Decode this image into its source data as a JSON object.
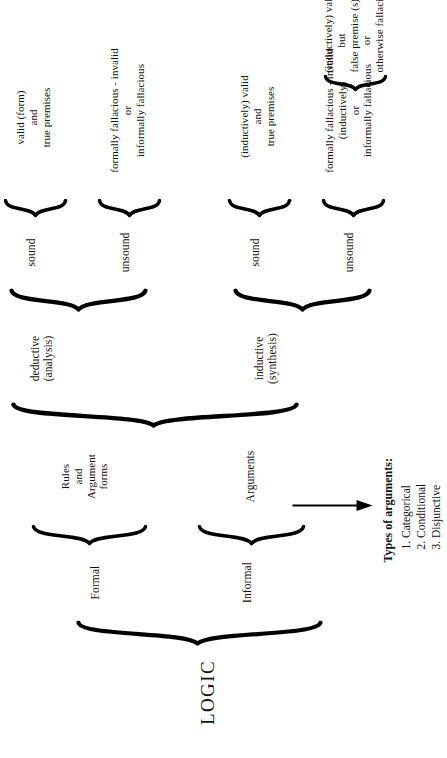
{
  "diagram": {
    "title": "LOGIC",
    "root": {
      "label": "LOGIC"
    },
    "level1": [
      {
        "label": "Formal"
      },
      {
        "label": "Informal"
      }
    ],
    "formal_detail": "Rules\nand\nArgument\nforms",
    "informal_detail": "Arguments",
    "level2": [
      {
        "label": "deductive\n(analysis)"
      },
      {
        "label": "inductive\n(synthesis)"
      }
    ],
    "level3": [
      {
        "label": "sound"
      },
      {
        "label": "unsound"
      },
      {
        "label": "sound"
      },
      {
        "label": "unsound"
      }
    ],
    "leaves": [
      {
        "text": "valid (form)\nand\ntrue premises"
      },
      {
        "text": "formally fallacious - invalid\nor\ninformally fallacious"
      },
      {
        "text": "(inductively) valid\nand\ntrue premises"
      },
      {
        "text": "formally fallacious - invalid\n(inductively)\nor\ninformally fallacious"
      }
    ],
    "leaf_extra": {
      "text": "(inductively) valid\nbut\nfalse premise (s)\nor\notherwise fallacious"
    },
    "types_panel": {
      "heading": "Types of arguments:",
      "items": [
        "1. Categorical",
        "2. Conditional",
        "3. Disjunctive"
      ]
    }
  },
  "colors": {
    "ink": "#111111",
    "page": "#ffffff"
  }
}
